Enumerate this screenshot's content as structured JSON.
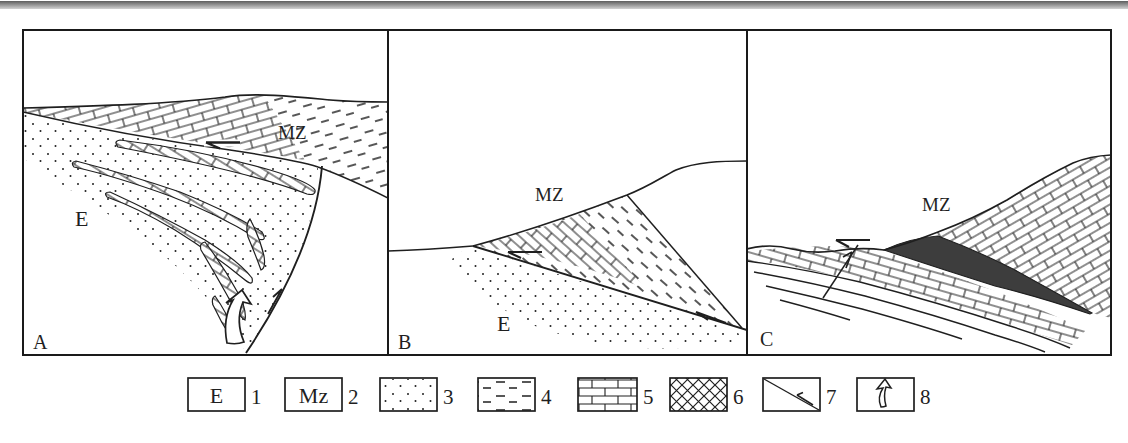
{
  "figure": {
    "type": "geological-cross-sections",
    "ink_color": "#1f1f1f",
    "thrust_wedge_fill_color": "#3d3d3d",
    "scan_bar_color": "#6e6e6e"
  },
  "panels": {
    "a": {
      "label": "A",
      "unit_mz": "MZ",
      "unit_e": "E"
    },
    "b": {
      "label": "B",
      "unit_mz": "MZ",
      "unit_e": "E"
    },
    "c": {
      "label": "C",
      "unit_mz": "MZ"
    }
  },
  "legend": {
    "items": [
      {
        "number": "1",
        "label": "E",
        "symbol": "unit-e-box"
      },
      {
        "number": "2",
        "label": "Mz",
        "symbol": "unit-mz-box"
      },
      {
        "number": "3",
        "label": "",
        "symbol": "dots-pattern"
      },
      {
        "number": "4",
        "label": "",
        "symbol": "dash-pattern"
      },
      {
        "number": "5",
        "label": "",
        "symbol": "brick-pattern"
      },
      {
        "number": "6",
        "label": "",
        "symbol": "crosshatch-pattern"
      },
      {
        "number": "7",
        "label": "",
        "symbol": "fault-with-slip-arrow"
      },
      {
        "number": "8",
        "label": "",
        "symbol": "open-movement-arrow"
      }
    ]
  }
}
